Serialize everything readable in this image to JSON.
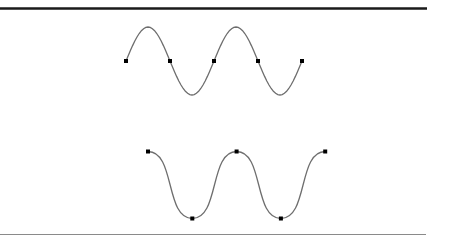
{
  "figure": {
    "colors": {
      "curve": "#6e6e6e",
      "point": "#000000",
      "top_rule": "#1a1a1a",
      "bottom_rule": "#8a8a8a"
    }
  },
  "curves": [
    {
      "name": "sine-curve",
      "style": "smooth",
      "control_points": [
        [
          0,
          0
        ],
        [
          1,
          0
        ],
        [
          2,
          0
        ],
        [
          3,
          0
        ],
        [
          4,
          0
        ]
      ],
      "extrema": [
        1,
        -1,
        1,
        -1
      ]
    },
    {
      "name": "square-wave-curve",
      "style": "rounded-square",
      "control_points": [
        [
          0,
          1
        ],
        [
          1,
          -1
        ],
        [
          2,
          1
        ],
        [
          3,
          -1
        ],
        [
          4,
          1
        ]
      ]
    }
  ]
}
